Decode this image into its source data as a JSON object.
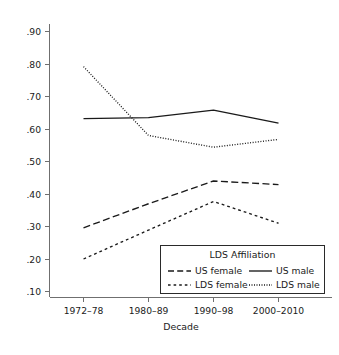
{
  "chart_data": {
    "type": "line",
    "title": "",
    "subtitle": "",
    "xlabel": "Decade",
    "ylabel": "",
    "categories": [
      "1972–78",
      "1980–89",
      "1990–98",
      "2000–2010"
    ],
    "ylim": [
      0.1,
      0.9
    ],
    "yticks": [
      0.9,
      0.8,
      0.7,
      0.6,
      0.5,
      0.4,
      0.3,
      0.2,
      0.1
    ],
    "ytick_labels": [
      ".90",
      ".80",
      ".70",
      ".60",
      ".50",
      ".40",
      ".30",
      ".20",
      ".10"
    ],
    "grid": false,
    "legend_position": "inside-bottom-right",
    "legend_title": "LDS Affiliation",
    "series": [
      {
        "name": "US male",
        "style": "solid",
        "color": "#1a1a1a",
        "values": [
          0.632,
          0.635,
          0.658,
          0.618
        ]
      },
      {
        "name": "LDS male",
        "style": "dotted",
        "color": "#1a1a1a",
        "values": [
          0.792,
          0.58,
          0.544,
          0.568
        ]
      },
      {
        "name": "US female",
        "style": "dashed",
        "color": "#1a1a1a",
        "values": [
          0.296,
          0.37,
          0.44,
          0.429
        ]
      },
      {
        "name": "LDS female",
        "style": "short-dashed",
        "color": "#1a1a1a",
        "values": [
          0.2,
          0.289,
          0.377,
          0.31
        ]
      }
    ]
  },
  "axes": {
    "y_tick_labels": [
      ".90",
      ".80",
      ".70",
      ".60",
      ".50",
      ".40",
      ".30",
      ".20",
      ".10"
    ],
    "x_tick_labels": [
      "1972–78",
      "1980–89",
      "1990–98",
      "2000–2010"
    ],
    "x_axis_title": "Decade"
  },
  "legend": {
    "title": "LDS Affiliation",
    "entries": [
      {
        "label": "US female",
        "style": "dashed"
      },
      {
        "label": "US male",
        "style": "solid"
      },
      {
        "label": "LDS female",
        "style": "short-dashed"
      },
      {
        "label": "LDS male",
        "style": "dotted"
      }
    ]
  }
}
